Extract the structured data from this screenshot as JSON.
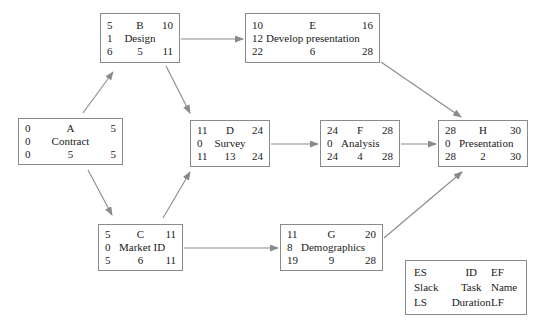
{
  "diagram": {
    "type": "pert-cpm-network",
    "background_color": "#ffffff",
    "line_color": "#8a8a8a",
    "text_color": "#1a1a1a"
  },
  "nodes": [
    {
      "key": "A",
      "id": "A",
      "name": "Contract",
      "es": "0",
      "ef": "5",
      "slack": "0",
      "ls": "0",
      "duration": "5",
      "lf": "5",
      "x": 18,
      "y": 118,
      "w": 105,
      "h": 47
    },
    {
      "key": "B",
      "id": "B",
      "name": "Design",
      "es": "5",
      "ef": "10",
      "slack": "1",
      "ls": "6",
      "duration": "5",
      "lf": "11",
      "x": 100,
      "y": 13,
      "w": 80,
      "h": 50
    },
    {
      "key": "E",
      "id": "E",
      "name": "Develop presentation",
      "es": "10",
      "ef": "16",
      "slack": "12",
      "ls": "22",
      "duration": "6",
      "lf": "28",
      "x": 245,
      "y": 13,
      "w": 135,
      "h": 50
    },
    {
      "key": "D",
      "id": "D",
      "name": "Survey",
      "es": "11",
      "ef": "24",
      "slack": "0",
      "ls": "11",
      "duration": "13",
      "lf": "24",
      "x": 190,
      "y": 120,
      "w": 80,
      "h": 47
    },
    {
      "key": "F",
      "id": "F",
      "name": "Analysis",
      "es": "24",
      "ef": "28",
      "slack": "0",
      "ls": "24",
      "duration": "4",
      "lf": "28",
      "x": 320,
      "y": 120,
      "w": 80,
      "h": 47
    },
    {
      "key": "H",
      "id": "H",
      "name": "Presentation",
      "es": "28",
      "ef": "30",
      "slack": "0",
      "ls": "28",
      "duration": "2",
      "lf": "30",
      "x": 438,
      "y": 120,
      "w": 90,
      "h": 47
    },
    {
      "key": "C",
      "id": "C",
      "name": "Market ID",
      "es": "5",
      "ef": "11",
      "slack": "0",
      "ls": "5",
      "duration": "6",
      "lf": "11",
      "x": 98,
      "y": 224,
      "w": 85,
      "h": 47
    },
    {
      "key": "G",
      "id": "G",
      "name": "Demographics",
      "es": "11",
      "ef": "20",
      "slack": "8",
      "ls": "19",
      "duration": "9",
      "lf": "28",
      "x": 280,
      "y": 224,
      "w": 103,
      "h": 47
    }
  ],
  "edges": [
    {
      "from": "A",
      "to": "B",
      "style": "diagonal-up"
    },
    {
      "from": "A",
      "to": "C",
      "style": "diagonal-down"
    },
    {
      "from": "B",
      "to": "E",
      "style": "horizontal"
    },
    {
      "from": "B",
      "to": "D",
      "style": "diagonal-down"
    },
    {
      "from": "C",
      "to": "D",
      "style": "diagonal-up"
    },
    {
      "from": "C",
      "to": "G",
      "style": "horizontal"
    },
    {
      "from": "D",
      "to": "F",
      "style": "horizontal"
    },
    {
      "from": "F",
      "to": "H",
      "style": "horizontal"
    },
    {
      "from": "E",
      "to": "H",
      "style": "diagonal-down"
    },
    {
      "from": "G",
      "to": "H",
      "style": "diagonal-up"
    }
  ],
  "legend": {
    "x": 405,
    "y": 260,
    "w": 122,
    "h": 55,
    "rows": [
      {
        "left": "ES",
        "center": "ID",
        "right": "EF"
      },
      {
        "left": "Slack",
        "center": "Task",
        "right": "Name"
      },
      {
        "left": "LS",
        "center": "Duration",
        "right": "LF"
      }
    ]
  }
}
